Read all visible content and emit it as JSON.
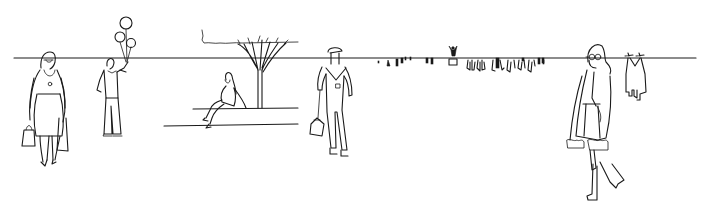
{
  "scene": {
    "type": "line-drawing",
    "description": "Black-and-white architectural entourage sketch of people along a horizon line",
    "background_color": "#ffffff",
    "ink_color": "#1a1a1a",
    "horizon_y": 58,
    "elements": [
      {
        "name": "woman-with-handbag",
        "x": 40
      },
      {
        "name": "man-with-balloons",
        "x": 110
      },
      {
        "name": "hedge-and-tree",
        "x": 250
      },
      {
        "name": "seated-woman-on-ledge",
        "x": 230
      },
      {
        "name": "worker-with-toolbox",
        "x": 335
      },
      {
        "name": "distant-crowd",
        "x": 470
      },
      {
        "name": "woman-in-fur-coat",
        "x": 600
      },
      {
        "name": "distant-couple",
        "x": 640
      }
    ]
  }
}
